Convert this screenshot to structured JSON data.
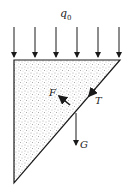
{
  "diagram": {
    "load_label": "q",
    "load_subscript": "0",
    "force_labels": {
      "normal": "F",
      "tension": "T",
      "weight": "G"
    },
    "colors": {
      "line": "#1a1a1a",
      "fill_base": "#ffffff",
      "speckle": "#555555"
    },
    "load_arrows_count": 6
  }
}
